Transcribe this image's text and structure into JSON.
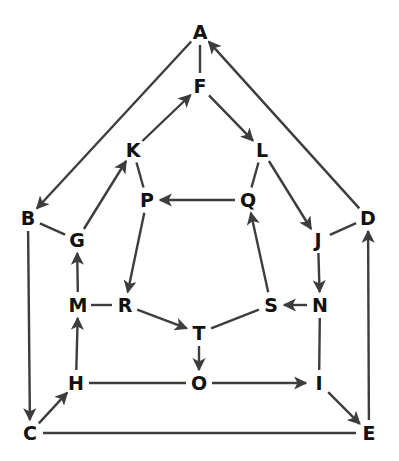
{
  "diagram": {
    "type": "directed-graph",
    "colors": {
      "edge": "#3d3d3d",
      "label": "#111111",
      "background": "#ffffff"
    },
    "nodes": [
      {
        "id": "A",
        "x": 200,
        "y": 32
      },
      {
        "id": "F",
        "x": 200,
        "y": 86
      },
      {
        "id": "K",
        "x": 133,
        "y": 150
      },
      {
        "id": "L",
        "x": 262,
        "y": 150
      },
      {
        "id": "P",
        "x": 147,
        "y": 200
      },
      {
        "id": "Q",
        "x": 248,
        "y": 200
      },
      {
        "id": "B",
        "x": 28,
        "y": 218
      },
      {
        "id": "G",
        "x": 77,
        "y": 240
      },
      {
        "id": "J",
        "x": 318,
        "y": 240
      },
      {
        "id": "D",
        "x": 368,
        "y": 218
      },
      {
        "id": "M",
        "x": 78,
        "y": 305
      },
      {
        "id": "R",
        "x": 125,
        "y": 305
      },
      {
        "id": "S",
        "x": 271,
        "y": 305
      },
      {
        "id": "N",
        "x": 320,
        "y": 305
      },
      {
        "id": "T",
        "x": 199,
        "y": 333
      },
      {
        "id": "H",
        "x": 76,
        "y": 383
      },
      {
        "id": "O",
        "x": 199,
        "y": 383
      },
      {
        "id": "I",
        "x": 319,
        "y": 383
      },
      {
        "id": "C",
        "x": 30,
        "y": 433
      },
      {
        "id": "E",
        "x": 369,
        "y": 433
      }
    ],
    "edges": [
      {
        "from": "A",
        "to": "F",
        "directed": false
      },
      {
        "from": "A",
        "to": "B",
        "directed": true
      },
      {
        "from": "D",
        "to": "A",
        "directed": true
      },
      {
        "from": "K",
        "to": "F",
        "directed": true
      },
      {
        "from": "F",
        "to": "L",
        "directed": true
      },
      {
        "from": "K",
        "to": "P",
        "directed": false
      },
      {
        "from": "L",
        "to": "Q",
        "directed": false
      },
      {
        "from": "Q",
        "to": "P",
        "directed": true
      },
      {
        "from": "L",
        "to": "J",
        "directed": true
      },
      {
        "from": "G",
        "to": "K",
        "directed": true
      },
      {
        "from": "B",
        "to": "G",
        "directed": false
      },
      {
        "from": "J",
        "to": "D",
        "directed": false
      },
      {
        "from": "J",
        "to": "N",
        "directed": true
      },
      {
        "from": "N",
        "to": "S",
        "directed": true
      },
      {
        "from": "S",
        "to": "Q",
        "directed": true
      },
      {
        "from": "P",
        "to": "R",
        "directed": true
      },
      {
        "from": "M",
        "to": "G",
        "directed": true
      },
      {
        "from": "M",
        "to": "R",
        "directed": false
      },
      {
        "from": "R",
        "to": "T",
        "directed": true
      },
      {
        "from": "T",
        "to": "S",
        "directed": false
      },
      {
        "from": "T",
        "to": "O",
        "directed": true
      },
      {
        "from": "H",
        "to": "M",
        "directed": true
      },
      {
        "from": "H",
        "to": "O",
        "directed": false
      },
      {
        "from": "O",
        "to": "I",
        "directed": true
      },
      {
        "from": "N",
        "to": "I",
        "directed": false
      },
      {
        "from": "I",
        "to": "E",
        "directed": true
      },
      {
        "from": "C",
        "to": "H",
        "directed": true
      },
      {
        "from": "B",
        "to": "C",
        "directed": true
      },
      {
        "from": "C",
        "to": "E",
        "directed": false
      },
      {
        "from": "E",
        "to": "D",
        "directed": true
      }
    ]
  }
}
